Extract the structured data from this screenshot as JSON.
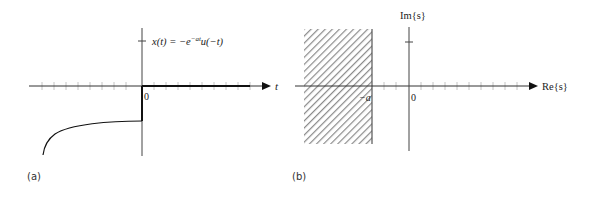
{
  "panel_a": {
    "label": "(a)",
    "equation": "x(t) = −e",
    "equation_exp": "−at",
    "equation_tail": "u(−t)",
    "x_axis_label": "t",
    "origin_label": "0"
  },
  "panel_b": {
    "label": "(b)",
    "im_axis_label": "Im{s}",
    "re_axis_label": "Re{s}",
    "origin_label": "0",
    "boundary_label": "−a",
    "roc": "Re{s} < −a (shaded region)"
  },
  "colors": {
    "ink": "#222222",
    "tick": "#bbbbbb",
    "hatch": "#888888"
  }
}
